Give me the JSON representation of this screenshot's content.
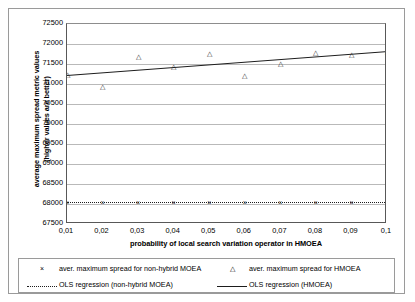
{
  "chart_data": {
    "type": "scatter",
    "title": "",
    "xlabel": "probability of local search variation operator in HMOEA",
    "ylabel_line1": "average maximum spread metric values",
    "ylabel_line2": "(higher values are better)",
    "x": [
      0.01,
      0.02,
      0.03,
      0.04,
      0.05,
      0.06,
      0.07,
      0.08,
      0.09,
      0.1
    ],
    "x_tick_labels": [
      "0,01",
      "0,02",
      "0,03",
      "0,04",
      "0,05",
      "0,06",
      "0,07",
      "0,08",
      "0,09",
      "0,1"
    ],
    "y_tick_labels": [
      "72500",
      "72000",
      "71500",
      "71000",
      "70500",
      "70000",
      "69500",
      "69000",
      "68500",
      "68000",
      "67500"
    ],
    "y_ticks": [
      72500,
      72000,
      71500,
      71000,
      70500,
      70000,
      69500,
      69000,
      68500,
      68000,
      67500
    ],
    "xlim": [
      0.01,
      0.1
    ],
    "ylim": [
      67500,
      72500
    ],
    "grid": true,
    "legend_position": "bottom",
    "series": [
      {
        "name": "aver. maximum spread for non-hybrid MOEA",
        "marker": "x",
        "values": [
          68040,
          68040,
          68040,
          68040,
          68040,
          68040,
          68040,
          68040,
          68040,
          68040
        ]
      },
      {
        "name": "aver. maximum spread for HMOEA",
        "marker": "triangle",
        "values": [
          71250,
          70950,
          71690,
          71455,
          71780,
          71215,
          71520,
          71795,
          71760,
          71820
        ]
      },
      {
        "name": "OLS regression (non-hybrid MOEA)",
        "marker": "dotted-line",
        "fit": [
          68040,
          68040
        ]
      },
      {
        "name": "OLS regression (HMOEA)",
        "marker": "solid-line",
        "fit": [
          71225,
          71820
        ]
      }
    ]
  },
  "legend": {
    "entries": [
      {
        "symbol": "×",
        "label": "aver. maximum spread for non-hybrid MOEA"
      },
      {
        "symbol": "△",
        "label": "aver. maximum spread for HMOEA"
      },
      {
        "symbol": "dotted",
        "label": "OLS regression (non-hybrid MOEA)"
      },
      {
        "symbol": "solid",
        "label": "OLS regression (HMOEA)"
      }
    ]
  }
}
